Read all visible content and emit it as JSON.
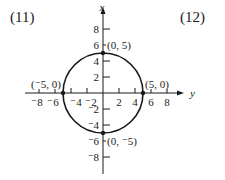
{
  "problem_numbers": {
    "left": "(11)",
    "right": "(12)"
  },
  "axes": {
    "vertical_label": "x",
    "horizontal_label": "y",
    "vertical_ticks": [
      {
        "value": 8,
        "label": "8"
      },
      {
        "value": 6,
        "label": "6"
      },
      {
        "value": 4,
        "label": "4"
      },
      {
        "value": 2,
        "label": "2"
      },
      {
        "value": -2,
        "label": "⁻2"
      },
      {
        "value": -4,
        "label": "⁻4"
      },
      {
        "value": -6,
        "label": "⁻6"
      },
      {
        "value": -8,
        "label": "⁻8"
      }
    ],
    "horizontal_ticks": [
      {
        "value": -8,
        "label": "⁻8"
      },
      {
        "value": -6,
        "label": "⁻6"
      },
      {
        "value": -4,
        "label": "⁻4"
      },
      {
        "value": -2,
        "label": "⁻2"
      },
      {
        "value": 2,
        "label": "2"
      },
      {
        "value": 4,
        "label": "4"
      },
      {
        "value": 6,
        "label": "6"
      },
      {
        "value": 8,
        "label": "8"
      }
    ]
  },
  "circle": {
    "center": [
      0,
      0
    ],
    "radius": 5,
    "stroke": "#1a1a1a"
  },
  "points": [
    {
      "label": "(0, 5)",
      "coords": [
        0,
        5
      ]
    },
    {
      "label": "(⁻5, 0)",
      "coords": [
        -5,
        0
      ]
    },
    {
      "label": "(5, 0)",
      "coords": [
        5,
        0
      ]
    },
    {
      "label": "(0, ⁻5)",
      "coords": [
        0,
        -5
      ]
    }
  ]
}
